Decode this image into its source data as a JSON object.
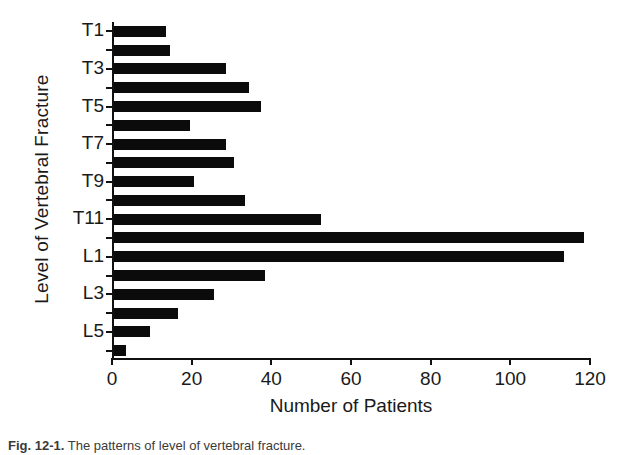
{
  "chart_data": {
    "type": "bar",
    "orientation": "horizontal",
    "title": "",
    "xlabel": "Number of Patients",
    "ylabel": "Level of Vertebral Fracture",
    "xlim": [
      0,
      120
    ],
    "ylim": null,
    "grid": false,
    "legend": null,
    "xticks": [
      "0",
      "20",
      "40",
      "60",
      "80",
      "100",
      "120"
    ],
    "xtick_values": [
      0,
      20,
      40,
      60,
      80,
      100,
      120
    ],
    "categories": [
      "T1",
      "T2",
      "T3",
      "T4",
      "T5",
      "T6",
      "T7",
      "T8",
      "T9",
      "T10",
      "T11",
      "T12",
      "L1",
      "L2",
      "L3",
      "L4",
      "L5",
      "S1"
    ],
    "ytick_labels_shown": [
      "T1",
      "T3",
      "T5",
      "T7",
      "T9",
      "T11",
      "L1",
      "L3",
      "L5"
    ],
    "values": [
      13,
      14,
      28,
      34,
      37,
      19,
      28,
      30,
      20,
      33,
      52,
      118,
      113,
      38,
      25,
      16,
      9,
      3
    ],
    "bar_color": "#0b0b0b",
    "background_color": "#ffffff"
  },
  "axes": {
    "x_title": "Number of Patients",
    "y_title": "Level of Vertebral Fracture"
  },
  "caption": {
    "figure_label": "Fig. 12-1.",
    "text": "The patterns of level of vertebral fracture."
  }
}
